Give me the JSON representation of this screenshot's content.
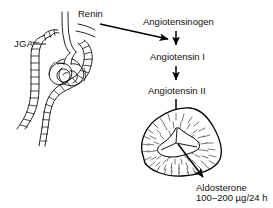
{
  "figure": {
    "title_alt": "Renin-angiotensin-aldosterone system",
    "background_color": "#ffffff",
    "ink_color": "#000000"
  },
  "labels": {
    "renin": "Renin",
    "jga": "JGA",
    "angiotensinogen": "Angiotensinogen",
    "angiotensin_i": "Angiotensin I",
    "angiotensin_ii": "Angiotensin II",
    "aldosterone": "Aldosterone",
    "aldosterone_dose": "100–200 µg/24 h"
  },
  "structures": {
    "nephron": "juxtaglomerular-apparatus-nephron-drawing",
    "adrenal": "adrenal-gland-cross-section-drawing"
  },
  "arrows": [
    {
      "name": "renin-to-angiotensinogen",
      "type": "diagonal"
    },
    {
      "name": "angiotensinogen-to-angiotensin-i",
      "type": "vertical"
    },
    {
      "name": "angiotensin-i-to-angiotensin-ii",
      "type": "vertical"
    },
    {
      "name": "angiotensin-ii-to-adrenal",
      "type": "vertical"
    },
    {
      "name": "adrenal-to-aldosterone",
      "type": "diagonal"
    }
  ]
}
